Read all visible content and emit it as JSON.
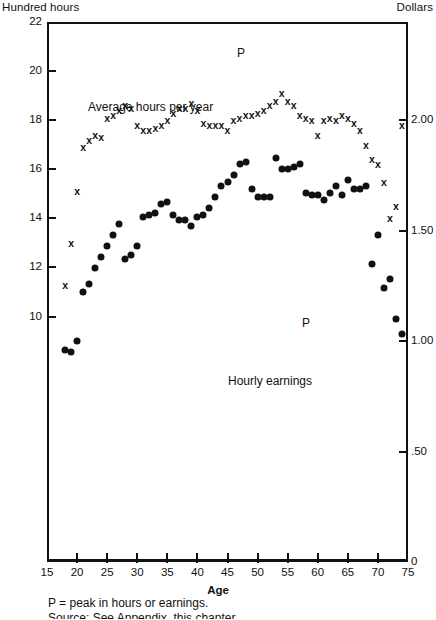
{
  "axes": {
    "left_title": "Hundred hours",
    "right_title": "Dollars",
    "x_label": "Age"
  },
  "footnotes": [
    "P = peak in hours or earnings.",
    "Source: See Appendix, this chapter."
  ],
  "chart_data": {
    "type": "scatter",
    "title": "",
    "subtitle": "",
    "xlabel": "Age",
    "ylabel": "Hundred hours",
    "y2label": "Dollars",
    "xlim": [
      15,
      75
    ],
    "ylim": [
      0,
      22
    ],
    "y2lim": [
      0,
      2.444
    ],
    "grid": false,
    "legend": "inline-annotation",
    "x_ticks": [
      15,
      20,
      25,
      30,
      35,
      40,
      45,
      50,
      55,
      60,
      65,
      70,
      75
    ],
    "y_ticks_left": [
      10,
      12,
      14,
      16,
      18,
      20,
      22
    ],
    "y_tick_labels_left": [
      "10",
      "12",
      "14",
      "16",
      "18",
      "20",
      "22"
    ],
    "y_ticks_right": [
      0,
      0.5,
      1.0,
      1.5,
      2.0
    ],
    "y_tick_labels_right": [
      "0",
      ".50",
      "1.00",
      "1.50",
      "2.00"
    ],
    "annotations": [
      {
        "text": "P",
        "series": "hours",
        "x": 49,
        "note": "peak in hours"
      },
      {
        "text": "P",
        "series": "earnings",
        "x": 60,
        "note": "peak in earnings"
      },
      {
        "text": "Average hours per year",
        "series": "hours"
      },
      {
        "text": "Hourly earnings",
        "series": "earnings"
      }
    ],
    "series": [
      {
        "name": "Average hours per year",
        "marker": "x",
        "axis": "left",
        "units": "hundred hours",
        "x": [
          18,
          19,
          20,
          21,
          22,
          23,
          24,
          25,
          26,
          27,
          28,
          29,
          30,
          31,
          32,
          33,
          34,
          35,
          36,
          37,
          38,
          39,
          40,
          41,
          42,
          43,
          44,
          45,
          46,
          47,
          48,
          49,
          50,
          51,
          52,
          53,
          54,
          55,
          56,
          57,
          58,
          59,
          60,
          61,
          62,
          63,
          64,
          65,
          66,
          67,
          68,
          69,
          70,
          71,
          72,
          73,
          74
        ],
        "values": [
          11.3,
          13.0,
          15.1,
          16.9,
          17.2,
          17.4,
          17.3,
          18.1,
          18.2,
          18.4,
          18.6,
          18.5,
          17.8,
          17.6,
          17.6,
          17.7,
          17.8,
          18.0,
          18.3,
          18.5,
          18.5,
          18.7,
          18.4,
          17.9,
          17.8,
          17.8,
          17.8,
          17.6,
          18.0,
          18.1,
          18.2,
          18.2,
          18.3,
          18.4,
          18.6,
          18.8,
          19.1,
          18.8,
          18.6,
          18.2,
          18.1,
          18.0,
          17.4,
          18.0,
          18.1,
          18.0,
          18.2,
          18.1,
          17.9,
          17.6,
          17.0,
          16.4,
          16.2,
          15.5,
          14.0,
          14.5,
          17.8
        ]
      },
      {
        "name": "Hourly earnings",
        "marker": "dot",
        "axis": "right",
        "units": "dollars",
        "x": [
          18,
          19,
          20,
          21,
          22,
          23,
          24,
          25,
          26,
          27,
          28,
          29,
          30,
          31,
          32,
          33,
          34,
          35,
          36,
          37,
          38,
          39,
          40,
          41,
          42,
          43,
          44,
          45,
          46,
          47,
          48,
          49,
          50,
          51,
          52,
          53,
          54,
          55,
          56,
          57,
          58,
          59,
          60,
          61,
          62,
          63,
          64,
          65,
          66,
          67,
          68,
          69,
          70,
          71,
          72,
          73,
          74
        ],
        "values": [
          0.96,
          0.95,
          1.0,
          1.22,
          1.26,
          1.33,
          1.38,
          1.43,
          1.48,
          1.53,
          1.37,
          1.39,
          1.43,
          1.56,
          1.57,
          1.58,
          1.62,
          1.63,
          1.57,
          1.55,
          1.55,
          1.52,
          1.56,
          1.57,
          1.6,
          1.65,
          1.7,
          1.72,
          1.75,
          1.8,
          1.81,
          1.69,
          1.65,
          1.65,
          1.65,
          1.83,
          1.78,
          1.78,
          1.79,
          1.8,
          1.67,
          1.66,
          1.66,
          1.64,
          1.67,
          1.7,
          1.66,
          1.73,
          1.69,
          1.69,
          1.7,
          1.35,
          1.48,
          1.24,
          1.28,
          1.1,
          1.03
        ]
      }
    ]
  }
}
